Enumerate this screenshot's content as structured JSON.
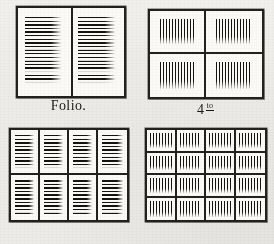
{
  "figure": {
    "background_color": "#f0efec",
    "ink_color": "#1b1917"
  },
  "panels": [
    {
      "id": "folio",
      "caption": "Folio.",
      "caption_number": "Folio.",
      "caption_superscript": "",
      "columns": 2,
      "rows": 1,
      "pages": 2,
      "text_direction": "horizontal"
    },
    {
      "id": "quarto",
      "caption": "4to",
      "caption_number": "4",
      "caption_superscript": "to",
      "columns": 2,
      "rows": 2,
      "pages": 4,
      "text_direction": "vertical"
    },
    {
      "id": "octavo",
      "caption": "8vo",
      "caption_number": "8",
      "caption_superscript": "vo",
      "columns": 4,
      "rows": 2,
      "pages": 8,
      "text_direction": "horizontal"
    },
    {
      "id": "sextodecimo",
      "caption": "16mo",
      "caption_number": "16",
      "caption_superscript": "mo",
      "columns": 4,
      "rows": 4,
      "pages": 16,
      "text_direction": "vertical"
    }
  ]
}
